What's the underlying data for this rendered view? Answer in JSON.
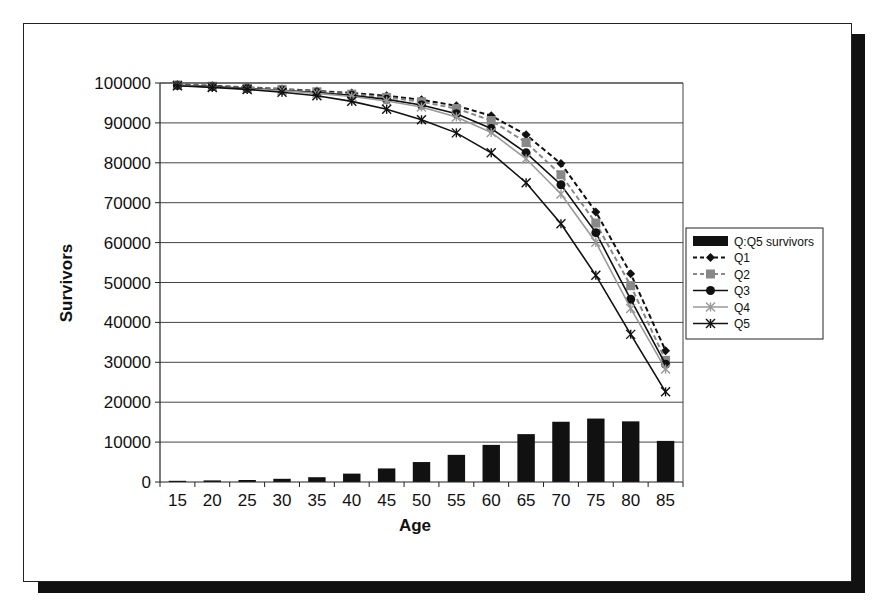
{
  "chart_data": {
    "type": "bar+line",
    "title": "",
    "xlabel": "Age",
    "ylabel": "Survivors",
    "ylim": [
      0,
      100000
    ],
    "yticks": [
      0,
      10000,
      20000,
      30000,
      40000,
      50000,
      60000,
      70000,
      80000,
      90000,
      100000
    ],
    "grid": true,
    "legend_position": "right",
    "categories": [
      "15",
      "20",
      "25",
      "30",
      "35",
      "40",
      "45",
      "50",
      "55",
      "60",
      "65",
      "70",
      "75",
      "80",
      "85"
    ],
    "series": [
      {
        "name": "Q:Q5 survivors",
        "kind": "bar",
        "color": "#111111",
        "values": [
          300,
          400,
          500,
          800,
          1200,
          2100,
          3400,
          5000,
          6800,
          9300,
          12000,
          15100,
          15900,
          15200,
          10300
        ]
      },
      {
        "name": "Q1",
        "kind": "line",
        "dash": "dashed",
        "marker": "diamond",
        "color": "#111111",
        "values": [
          99600,
          99300,
          98900,
          98500,
          98000,
          97500,
          96800,
          95800,
          94300,
          91800,
          87000,
          79800,
          67700,
          52200,
          32900
        ]
      },
      {
        "name": "Q2",
        "kind": "line",
        "dash": "dashed",
        "marker": "square",
        "color": "#888888",
        "values": [
          99500,
          99200,
          98800,
          98400,
          97800,
          97200,
          96400,
          95300,
          93600,
          90600,
          85100,
          77000,
          64900,
          49200,
          30500
        ]
      },
      {
        "name": "Q3",
        "kind": "line",
        "dash": "solid",
        "marker": "circle",
        "color": "#111111",
        "values": [
          99400,
          99100,
          98600,
          98200,
          97600,
          96900,
          95900,
          94500,
          92300,
          88600,
          82500,
          74500,
          62500,
          45800,
          29500
        ]
      },
      {
        "name": "Q4",
        "kind": "line",
        "dash": "solid",
        "marker": "asterisk",
        "color": "#999999",
        "values": [
          99400,
          99000,
          98500,
          98100,
          97400,
          96600,
          95500,
          94000,
          91500,
          87600,
          81000,
          72200,
          60100,
          43500,
          28300
        ]
      },
      {
        "name": "Q5",
        "kind": "line",
        "dash": "solid",
        "marker": "star",
        "color": "#111111",
        "values": [
          99300,
          98900,
          98400,
          97700,
          96800,
          95400,
          93400,
          90800,
          87500,
          82500,
          75000,
          64700,
          51800,
          37000,
          22600
        ]
      }
    ]
  },
  "legend": {
    "items": [
      "Q:Q5 survivors",
      "Q1",
      "Q2",
      "Q3",
      "Q4",
      "Q5"
    ]
  }
}
